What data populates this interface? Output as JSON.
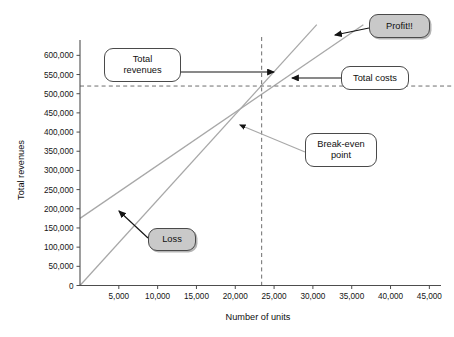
{
  "chart_data": {
    "type": "line",
    "title": "",
    "xlabel": "Number of units",
    "ylabel": "Total revenues",
    "xlim": [
      0,
      46500
    ],
    "ylim": [
      0,
      640000
    ],
    "xticks": [
      "5,000",
      "10,000",
      "15,000",
      "20,000",
      "25,000",
      "30,000",
      "35,000",
      "40,000",
      "45,000"
    ],
    "xtick_values": [
      5000,
      10000,
      15000,
      20000,
      25000,
      30000,
      35000,
      40000,
      45000
    ],
    "yticks": [
      "0",
      "50,000",
      "100,000",
      "150,000",
      "200,000",
      "250,000",
      "300,000",
      "350,000",
      "400,000",
      "450,000",
      "500,000",
      "550,000",
      "600,000"
    ],
    "ytick_values": [
      0,
      50000,
      100000,
      150000,
      200000,
      250000,
      300000,
      350000,
      400000,
      450000,
      500000,
      550000,
      600000
    ],
    "grid": false,
    "legend": "none",
    "series": [
      {
        "name": "Total revenues",
        "type": "line",
        "color": "#a8a8a8",
        "x": [
          0,
          30500
        ],
        "values": [
          0,
          680000
        ],
        "note": "straight line through origin, slope ~22.3 per unit"
      },
      {
        "name": "Total costs",
        "type": "line",
        "color": "#a8a8a8",
        "x": [
          0,
          36500
        ],
        "values": [
          175000,
          680000
        ],
        "note": "fixed costs ~175,000 intercept, slope ~14.8 per unit"
      }
    ],
    "breakeven": {
      "label": "Break-even point",
      "x": 23400,
      "y": 520000
    },
    "reference_lines": [
      {
        "name": "breakeven-vertical",
        "orientation": "vertical",
        "value": 23400,
        "style": "dashed",
        "color": "#6e6e6e"
      },
      {
        "name": "breakeven-horizontal",
        "orientation": "horizontal",
        "value": 520000,
        "style": "dashed",
        "color": "#6e6e6e"
      }
    ],
    "annotations": [
      {
        "id": "total-revenues",
        "text": "Total\nrevenues",
        "fill": "white",
        "arrow": "right"
      },
      {
        "id": "profit",
        "text": "Profit!!",
        "fill": "gray",
        "arrow": "left"
      },
      {
        "id": "total-costs",
        "text": "Total costs",
        "fill": "white",
        "arrow": "left"
      },
      {
        "id": "break-even-point",
        "text": "Break-even\npoint",
        "fill": "white",
        "arrow": "left-up"
      },
      {
        "id": "loss",
        "text": "Loss",
        "fill": "gray",
        "arrow": "left-up"
      }
    ]
  },
  "axis": {
    "ylabel": "Total revenues",
    "xlabel": "Number of units"
  },
  "callouts": {
    "total_revenues": "Total\nrevenues",
    "profit": "Profit!!",
    "total_costs": "Total costs",
    "break_even": "Break-even\npoint",
    "loss": "Loss"
  },
  "colors": {
    "line": "#a8a8a8",
    "dash": "#6e6e6e",
    "axis": "#4d4d4d",
    "callout_fill": "#c9c9c9",
    "callout_border": "#4a4a4a",
    "text": "#101010"
  }
}
